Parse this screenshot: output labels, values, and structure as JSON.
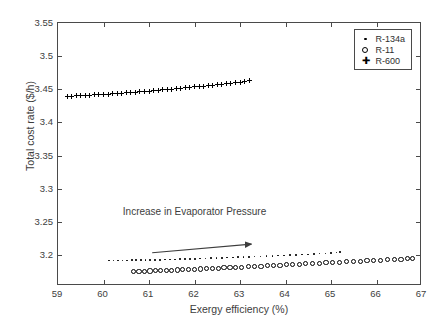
{
  "chart_data": {
    "type": "scatter",
    "title": "",
    "xlabel": "Exergy efficiency (%)",
    "ylabel": "Total cost rate ($/h)",
    "xlim": [
      59,
      67
    ],
    "ylim": [
      3.1533,
      3.55
    ],
    "xticks": [
      59,
      60,
      61,
      62,
      63,
      64,
      65,
      66,
      67
    ],
    "xticklabels": [
      "59",
      "60",
      "61",
      "62",
      "63",
      "64",
      "65",
      "66",
      "67"
    ],
    "yticks": [
      3.2,
      3.25,
      3.3,
      3.35,
      3.4,
      3.45,
      3.5,
      3.55
    ],
    "yticklabels": [
      "3.2",
      "3.25",
      "3.3",
      "3.35",
      "3.4",
      "3.45",
      "3.5",
      "3.55"
    ],
    "grid": false,
    "legend_position": "upper right",
    "annotations": [
      {
        "text": "Increase in Evaporator Pressure",
        "x": 62.0,
        "y": 3.2665,
        "arrow_start": [
          61.07,
          3.2035
        ],
        "arrow_end": [
          63.25,
          3.2165
        ]
      }
    ],
    "series": [
      {
        "name": "R-134a",
        "marker": "dot",
        "x": [
          60.12,
          60.22,
          60.32,
          60.42,
          60.52,
          60.62,
          60.72,
          60.82,
          60.92,
          61.02,
          61.13,
          61.24,
          61.35,
          61.46,
          61.57,
          61.68,
          61.79,
          61.9,
          62.01,
          62.12,
          62.24,
          62.36,
          62.48,
          62.6,
          62.72,
          62.84,
          62.96,
          63.08,
          63.2,
          63.32,
          63.45,
          63.58,
          63.71,
          63.84,
          63.97,
          64.1,
          64.23,
          64.36,
          64.49,
          64.62,
          64.75,
          64.88,
          65.0,
          65.12,
          65.2
        ],
        "y": [
          3.1918,
          3.1918,
          3.1919,
          3.1919,
          3.192,
          3.1921,
          3.1922,
          3.1923,
          3.1924,
          3.1925,
          3.1927,
          3.1929,
          3.1931,
          3.1933,
          3.1935,
          3.1937,
          3.1939,
          3.1941,
          3.1943,
          3.1945,
          3.1948,
          3.1951,
          3.1954,
          3.1957,
          3.196,
          3.1963,
          3.1966,
          3.1969,
          3.1972,
          3.1975,
          3.1979,
          3.1983,
          3.1987,
          3.1991,
          3.1995,
          3.1999,
          3.2003,
          3.2007,
          3.2011,
          3.2016,
          3.2021,
          3.2026,
          3.2032,
          3.2038,
          3.2046
        ]
      },
      {
        "name": "R-11",
        "marker": "circle",
        "x": [
          60.66,
          60.78,
          60.9,
          61.02,
          61.14,
          61.26,
          61.38,
          61.5,
          61.62,
          61.74,
          61.87,
          62.0,
          62.13,
          62.26,
          62.39,
          62.52,
          62.65,
          62.78,
          62.91,
          63.04,
          63.18,
          63.32,
          63.46,
          63.6,
          63.74,
          63.88,
          64.02,
          64.16,
          64.3,
          64.44,
          64.59,
          64.74,
          64.89,
          65.04,
          65.19,
          65.34,
          65.49,
          65.64,
          65.79,
          65.94,
          66.09,
          66.24,
          66.39,
          66.54,
          66.69,
          66.8
        ],
        "y": [
          3.1752,
          3.1754,
          3.1757,
          3.176,
          3.1763,
          3.1766,
          3.1769,
          3.1772,
          3.1775,
          3.1778,
          3.1782,
          3.1786,
          3.179,
          3.1794,
          3.1798,
          3.1802,
          3.1806,
          3.181,
          3.1814,
          3.1818,
          3.1823,
          3.1828,
          3.1833,
          3.1838,
          3.1843,
          3.1848,
          3.1853,
          3.1858,
          3.1863,
          3.1868,
          3.1873,
          3.1878,
          3.1883,
          3.1888,
          3.1893,
          3.1898,
          3.1903,
          3.1908,
          3.1913,
          3.1918,
          3.1923,
          3.1928,
          3.1933,
          3.1938,
          3.1943,
          3.1948
        ]
      },
      {
        "name": "R-600",
        "marker": "star",
        "x": [
          59.2,
          59.3,
          59.4,
          59.5,
          59.6,
          59.7,
          59.8,
          59.9,
          60.0,
          60.1,
          60.2,
          60.3,
          60.4,
          60.5,
          60.6,
          60.7,
          60.8,
          60.9,
          61.0,
          61.1,
          61.2,
          61.3,
          61.4,
          61.5,
          61.6,
          61.7,
          61.8,
          61.9,
          62.0,
          62.1,
          62.2,
          62.3,
          62.4,
          62.5,
          62.6,
          62.7,
          62.8,
          62.9,
          63.0,
          63.1,
          63.2
        ],
        "y": [
          3.4395,
          3.4398,
          3.4401,
          3.4404,
          3.4408,
          3.4412,
          3.4416,
          3.442,
          3.4424,
          3.4428,
          3.4433,
          3.4438,
          3.4443,
          3.4448,
          3.4453,
          3.4458,
          3.4463,
          3.4468,
          3.4474,
          3.448,
          3.4486,
          3.4492,
          3.4498,
          3.4504,
          3.451,
          3.4516,
          3.4522,
          3.4528,
          3.4535,
          3.4542,
          3.4549,
          3.4556,
          3.4563,
          3.457,
          3.4577,
          3.4584,
          3.4591,
          3.4598,
          3.4605,
          3.4617,
          3.4628
        ]
      }
    ]
  },
  "legend": {
    "entries": [
      {
        "label": "R-134a",
        "marker": "dot-marker"
      },
      {
        "label": "R-11",
        "marker": "circle-marker"
      },
      {
        "label": "R-600",
        "marker": "star-marker"
      }
    ]
  }
}
